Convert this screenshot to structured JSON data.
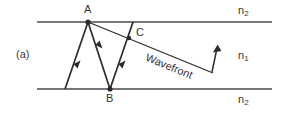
{
  "figure": {
    "panel_label": "(a)",
    "caption_note": "",
    "points": [
      {
        "name": "A",
        "label": "A",
        "x": 88,
        "y": 22,
        "label_x": 84,
        "label_y": 5
      },
      {
        "name": "B",
        "label": "B",
        "x": 110,
        "y": 89,
        "label_x": 106,
        "label_y": 93
      },
      {
        "name": "C",
        "label": "C",
        "x": 129,
        "y": 38,
        "label_x": 136,
        "label_y": 28
      }
    ],
    "media": {
      "upper_label": "n",
      "upper_sub": "2",
      "core_label": "n",
      "core_sub": "1",
      "lower_label": "n",
      "lower_sub": "2"
    },
    "wavefront": {
      "label": "Wavefront",
      "angle_deg": 18.5,
      "label_x": 158,
      "label_y": 66,
      "start_x": 88,
      "start_y": 22,
      "end_x": 213,
      "end_y": 73,
      "normal_arrow_base_x": 212,
      "normal_arrow_base_y": 72,
      "normal_arrow_tip_x": 217,
      "normal_arrow_tip_y": 45
    },
    "boundaries": {
      "top_y": 22,
      "bottom_y": 89,
      "left_x": 37,
      "right_x": 272
    },
    "rays": [
      {
        "name": "incident-ray",
        "x1": 65,
        "y1": 89,
        "x2": 88,
        "y2": 22
      },
      {
        "name": "reflected-ray-ab",
        "x1": 88,
        "y1": 22,
        "x2": 110,
        "y2": 89
      },
      {
        "name": "reflected-ray-bc",
        "x1": 110,
        "y1": 89,
        "x2": 133,
        "y2": 22
      }
    ],
    "colors": {
      "line": "#4a4a4a",
      "ray": "#2b2b2b",
      "text": "#3a3a3a",
      "background": "#ffffff"
    }
  }
}
